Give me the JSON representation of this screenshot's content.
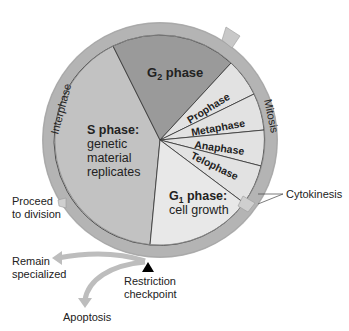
{
  "diagram": {
    "ring_labels": {
      "interphase": "Interphase",
      "mitosis": "Mitosis"
    },
    "phases": {
      "g2": {
        "label_main": "G",
        "label_sub": "2",
        "label_rest": " phase"
      },
      "s": {
        "title": "S phase:",
        "line1": "genetic",
        "line2": "material",
        "line3": "replicates"
      },
      "g1": {
        "label_main": "G",
        "label_sub": "1",
        "label_rest": " phase:",
        "line1": "cell growth"
      },
      "mitosis_stages": [
        "Prophase",
        "Metaphase",
        "Anaphase",
        "Telophase"
      ]
    },
    "callouts": {
      "cytokinesis": "Cytokinesis",
      "proceed_line1": "Proceed",
      "proceed_line2": "to division",
      "remain_line1": "Remain",
      "remain_line2": "specialized",
      "restriction_line1": "Restriction",
      "restriction_line2": "checkpoint",
      "apoptosis": "Apoptosis"
    },
    "colors": {
      "ring": "#b4b4b4",
      "s_phase": "#c2c2c2",
      "g2_phase": "#9a9a9a",
      "mitosis_stages": "#e2e2e2",
      "g1_phase": "#e8e8e8",
      "text": "#222222",
      "arrow": "#bdbdbd"
    }
  }
}
